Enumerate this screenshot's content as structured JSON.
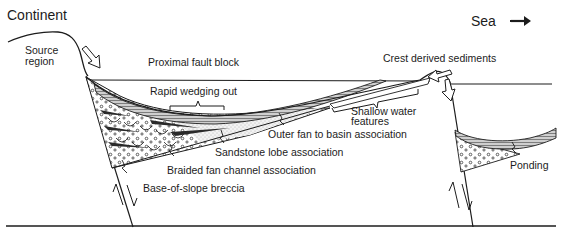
{
  "diagram": {
    "type": "geological cross-section",
    "orientation": {
      "left": "Continent",
      "right": "Sea",
      "direction_arrow": "right-arrow"
    },
    "labels": {
      "continent": "Continent",
      "sea": "Sea",
      "source_region_line1": "Source",
      "source_region_line2": "region",
      "proximal_fault_block": "Proximal fault block",
      "rapid_wedging_out": "Rapid wedging out",
      "crest_derived_sediments": "Crest derived sediments",
      "shallow_water_line1": "Shallow water",
      "shallow_water_line2": "features",
      "outer_fan": "Outer fan to basin association",
      "sandstone_lobe": "Sandstone lobe association",
      "braided_fan_channel": "Braided fan channel association",
      "base_of_slope_breccia": "Base-of-slope breccia",
      "ponding": "Ponding"
    },
    "elements": [
      {
        "id": "source-region-profile",
        "kind": "topographic profile"
      },
      {
        "id": "left-fault",
        "kind": "normal fault",
        "motion": "paired half-arrows"
      },
      {
        "id": "right-fault",
        "kind": "normal fault",
        "motion": "paired half-arrows"
      },
      {
        "id": "sea-level-left",
        "kind": "water surface line"
      },
      {
        "id": "sea-level-right",
        "kind": "water surface line"
      },
      {
        "id": "basin-floor",
        "kind": "baseline"
      },
      {
        "id": "main-basin-fill",
        "kind": "wedge of breccia and fan sediments"
      },
      {
        "id": "ponded-basin-fill",
        "kind": "laminated pond fill over breccia"
      },
      {
        "id": "sediment-input-arrow-left",
        "kind": "hollow arrow"
      },
      {
        "id": "sediment-input-arrow-crest",
        "kind": "hollow arrow"
      },
      {
        "id": "sediment-input-arrow-right",
        "kind": "hollow arrow"
      }
    ]
  },
  "colors": {
    "ink": "#1c1c1c",
    "background": "#ffffff",
    "fan_shade": "#6a6a6a",
    "sand_stipple": "#e8e8e8"
  }
}
